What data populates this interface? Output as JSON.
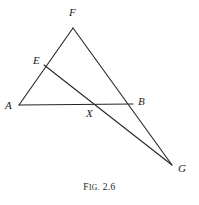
{
  "figure": {
    "caption_prefix": "F",
    "caption_smallcaps": "IG.",
    "caption_number": "2.6",
    "caption_full": "FIG. 2.6",
    "stroke_color": "#262626",
    "background_color": "#ffffff",
    "stroke_width": 1.1
  },
  "points": [
    {
      "id": "A",
      "label": "A",
      "x": 19,
      "y": 105,
      "label_x": 5,
      "label_y": 100
    },
    {
      "id": "B",
      "label": "B",
      "x": 133,
      "y": 104,
      "label_x": 138,
      "label_y": 96
    },
    {
      "id": "E",
      "label": "E",
      "x": 44,
      "y": 65,
      "label_x": 33,
      "label_y": 55
    },
    {
      "id": "F",
      "label": "F",
      "x": 73,
      "y": 28,
      "label_x": 69,
      "label_y": 7
    },
    {
      "id": "G",
      "label": "G",
      "x": 172,
      "y": 165,
      "label_x": 178,
      "label_y": 163
    },
    {
      "id": "X",
      "label": "X",
      "x": 93,
      "y": 105,
      "label_x": 86,
      "label_y": 108
    }
  ],
  "segments": [
    {
      "id": "A-F",
      "from": "A",
      "to": "F",
      "passes_through": "E"
    },
    {
      "id": "A-B",
      "from": "A",
      "to": "B",
      "passes_through": "X"
    },
    {
      "id": "F-G",
      "from": "F",
      "to": "G",
      "passes_through": "B"
    },
    {
      "id": "E-G",
      "from": "E",
      "to": "G",
      "passes_through": "X"
    }
  ]
}
